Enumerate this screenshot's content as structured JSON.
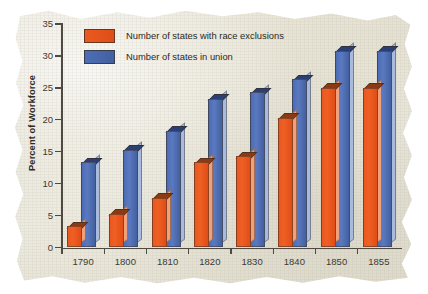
{
  "chart_data": {
    "type": "bar",
    "title": "",
    "xlabel": "",
    "ylabel": "Percent of Workforce",
    "categories": [
      "1790",
      "1800",
      "1810",
      "1820",
      "1830",
      "1840",
      "1850",
      "1855"
    ],
    "series": [
      {
        "name": "Number of states with race exclusions",
        "color": "#e9581f",
        "values": [
          3,
          5,
          7.5,
          13,
          14,
          20,
          24.7,
          24.7
        ]
      },
      {
        "name": "Number of states in union",
        "color": "#4b6cb4",
        "values": [
          13,
          15,
          18,
          23,
          24,
          26,
          30.5,
          30.5
        ]
      }
    ],
    "ylim": [
      0,
      35
    ],
    "yticks": [
      0,
      5,
      10,
      15,
      20,
      25,
      30,
      35
    ],
    "ytick_labels": [
      "0",
      "5",
      "10",
      "15",
      "20",
      "25",
      "30",
      "35"
    ],
    "grid": false,
    "legend_position": "top-left"
  },
  "legend": {
    "entries": [
      {
        "label": "Number of states with race exclusions",
        "swatch": "orange"
      },
      {
        "label": "Number of states in union",
        "swatch": "blue"
      }
    ]
  },
  "axes": {
    "y_title": "Percent of Workforce"
  }
}
